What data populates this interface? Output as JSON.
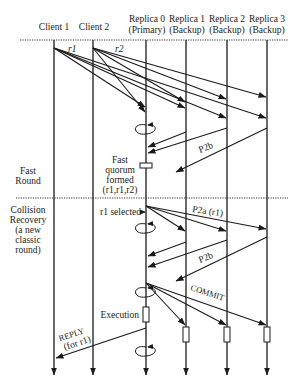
{
  "diagram": {
    "type": "sequence-diagram",
    "participants": [
      {
        "id": "client1",
        "label": "Client 1",
        "sublabel": ""
      },
      {
        "id": "client2",
        "label": "Client 2",
        "sublabel": ""
      },
      {
        "id": "replica0",
        "label": "Replica 0",
        "sublabel": "(Primary)"
      },
      {
        "id": "replica1",
        "label": "Replica 1",
        "sublabel": "(Backup)"
      },
      {
        "id": "replica2",
        "label": "Replica 2",
        "sublabel": "(Backup)"
      },
      {
        "id": "replica3",
        "label": "Replica 3",
        "sublabel": "(Backup)"
      }
    ],
    "phases": [
      {
        "label_lines": [
          "Fast",
          "Round"
        ]
      },
      {
        "label_lines": [
          "Collision",
          "Recovery",
          "(a new",
          "classic",
          "round)"
        ]
      }
    ],
    "messages": {
      "r1": "r1",
      "r2": "r2",
      "p2b_fast": "P2b",
      "p2a": "P2a (r1)",
      "p2b_classic": "P2b",
      "commit": "COMMIT",
      "reply_line1": "REPLY",
      "reply_line2": "(for r1)"
    },
    "annotations": {
      "fast_quorum": [
        "Fast",
        "quorum",
        "formed",
        "(r1,r1,r2)"
      ],
      "r1_selected": "r1 selected",
      "execution": "Execution"
    }
  }
}
